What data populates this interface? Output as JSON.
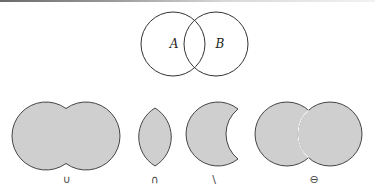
{
  "diagram": {
    "type": "venn-set-operations",
    "colors": {
      "fill": "#cfcfcf",
      "stroke": "#333333",
      "background": "#ffffff"
    },
    "base": {
      "sets": [
        {
          "label": "A",
          "cx": 173,
          "cy": 44,
          "r": 32
        },
        {
          "label": "B",
          "cx": 216,
          "cy": 44,
          "r": 32
        }
      ]
    },
    "operations": [
      {
        "name": "union",
        "symbol": "∪",
        "cx_left": 46,
        "cx_right": 86,
        "cy": 136,
        "r": 34
      },
      {
        "name": "intersection",
        "symbol": "∩",
        "cx": 155,
        "cy": 137
      },
      {
        "name": "difference",
        "symbol": "\\",
        "cx_left": 218,
        "cx_right": 258,
        "cy": 134,
        "r": 32
      },
      {
        "name": "symmetric-difference",
        "symbol": "⊖",
        "cx_left": 287,
        "cx_right": 330,
        "cy": 134,
        "r": 32
      }
    ]
  }
}
